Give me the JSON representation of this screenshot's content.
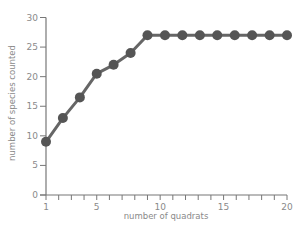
{
  "chart_data": {
    "type": "line",
    "title": "",
    "xlabel": "number of quadrats",
    "ylabel": "number of species counted",
    "xlim": [
      1,
      20
    ],
    "ylim": [
      0,
      30
    ],
    "x_ticks_major": [
      1,
      5,
      10,
      15,
      20
    ],
    "x_ticks_minor_step": 1,
    "y_ticks": [
      0,
      5,
      10,
      15,
      20,
      25,
      30
    ],
    "grid": false,
    "legend": null,
    "series": [
      {
        "name": "species count",
        "marker": "circle",
        "x": [
          1,
          2.33,
          3.67,
          5,
          6.33,
          7.67,
          9,
          10.38,
          11.75,
          13.13,
          14.5,
          15.88,
          17.25,
          18.63,
          20
        ],
        "values": [
          9,
          13,
          16.5,
          20.5,
          22,
          24,
          27,
          27,
          27,
          27,
          27,
          27,
          27,
          27,
          27
        ]
      }
    ],
    "colors": {
      "line": "#666666",
      "marker": "#555555",
      "axis": "#777777",
      "text": "#8a8a8a"
    }
  }
}
